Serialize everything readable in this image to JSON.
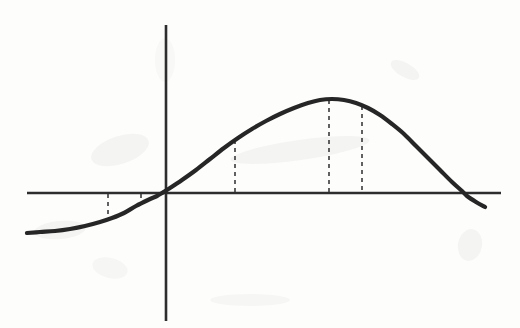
{
  "figure": {
    "kind": "hand-drawn-scanned-graph",
    "background_color": "#fdfdfc",
    "ink_color": "#262626",
    "axis_color": "#2d2d2d",
    "dash_color": "#3a3a3a",
    "width": 520,
    "height": 328,
    "title": "",
    "caption": ""
  },
  "axes": {
    "x_axis": {
      "label": "",
      "y_pixel": 193,
      "x_start": 27,
      "x_end": 501,
      "stroke_width": 2.6,
      "ticks": [],
      "tick_labels": []
    },
    "y_axis": {
      "label": "",
      "x_pixel": 166,
      "y_start": 25,
      "y_end": 321,
      "stroke_width": 2.6,
      "ticks": [],
      "tick_labels": []
    },
    "origin": {
      "x": 166,
      "y": 193
    }
  },
  "chart_data": {
    "type": "line",
    "title": "",
    "subtitle": "",
    "xlabel": "",
    "ylabel": "",
    "grid": false,
    "legend": [],
    "legend_position": "none",
    "xlim": [
      27,
      501
    ],
    "ylim": [
      25,
      321
    ],
    "axis_origin_px": {
      "x": 166,
      "y": 193
    },
    "series": [
      {
        "name": "curve",
        "stroke_width": 4.2,
        "points_px": [
          [
            27,
            233
          ],
          [
            40,
            232
          ],
          [
            55,
            231
          ],
          [
            70,
            229
          ],
          [
            85,
            226
          ],
          [
            100,
            222
          ],
          [
            112,
            218
          ],
          [
            124,
            213
          ],
          [
            136,
            206
          ],
          [
            148,
            200
          ],
          [
            157,
            196
          ],
          [
            162,
            193
          ],
          [
            170,
            188
          ],
          [
            182,
            180
          ],
          [
            196,
            170
          ],
          [
            210,
            159
          ],
          [
            224,
            148
          ],
          [
            238,
            138
          ],
          [
            252,
            129
          ],
          [
            266,
            121
          ],
          [
            280,
            114
          ],
          [
            294,
            108
          ],
          [
            308,
            103
          ],
          [
            320,
            100
          ],
          [
            332,
            99
          ],
          [
            344,
            100
          ],
          [
            356,
            103
          ],
          [
            368,
            108
          ],
          [
            380,
            115
          ],
          [
            392,
            124
          ],
          [
            404,
            134
          ],
          [
            416,
            146
          ],
          [
            428,
            158
          ],
          [
            440,
            170
          ],
          [
            452,
            182
          ],
          [
            462,
            191
          ],
          [
            467,
            196
          ],
          [
            476,
            202
          ],
          [
            485,
            207
          ]
        ],
        "x_axis_crossings_px": [
          162,
          467
        ],
        "maximum_px": {
          "x": 331,
          "y": 99
        },
        "left_plateau_y_px": 233,
        "right_endpoint_px": {
          "x": 485,
          "y": 207
        }
      }
    ],
    "dashed_markers": [
      {
        "id": "marker-1",
        "x_px": 108,
        "from_y_px": 194,
        "to_y_px": 221,
        "side": "below-axis"
      },
      {
        "id": "marker-2",
        "x_px": 141,
        "from_y_px": 194,
        "to_y_px": 204,
        "side": "below-axis"
      },
      {
        "id": "marker-3",
        "x_px": 235,
        "from_y_px": 140,
        "to_y_px": 192,
        "side": "above-axis"
      },
      {
        "id": "marker-4",
        "x_px": 329,
        "from_y_px": 100,
        "to_y_px": 192,
        "side": "above-axis"
      },
      {
        "id": "marker-5",
        "x_px": 362,
        "from_y_px": 106,
        "to_y_px": 192,
        "side": "above-axis"
      }
    ],
    "dash_pattern": "4 4",
    "dash_stroke_width": 1.6
  },
  "artifacts": {
    "description": "Faint gray scanner smudges and ghost pencil marks on the paper background.",
    "smudges": [
      {
        "x": 120,
        "y": 150,
        "rx": 30,
        "ry": 14,
        "rotate": -18,
        "opacity": 0.055
      },
      {
        "x": 300,
        "y": 150,
        "rx": 70,
        "ry": 10,
        "rotate": -8,
        "opacity": 0.05
      },
      {
        "x": 405,
        "y": 70,
        "rx": 16,
        "ry": 7,
        "rotate": 30,
        "opacity": 0.05
      },
      {
        "x": 60,
        "y": 230,
        "rx": 26,
        "ry": 9,
        "rotate": -5,
        "opacity": 0.05
      },
      {
        "x": 470,
        "y": 245,
        "rx": 12,
        "ry": 16,
        "rotate": 10,
        "opacity": 0.05
      },
      {
        "x": 110,
        "y": 268,
        "rx": 18,
        "ry": 10,
        "rotate": 14,
        "opacity": 0.045
      },
      {
        "x": 250,
        "y": 300,
        "rx": 40,
        "ry": 6,
        "rotate": 0,
        "opacity": 0.04
      },
      {
        "x": 165,
        "y": 60,
        "rx": 10,
        "ry": 22,
        "rotate": 0,
        "opacity": 0.03
      }
    ]
  }
}
